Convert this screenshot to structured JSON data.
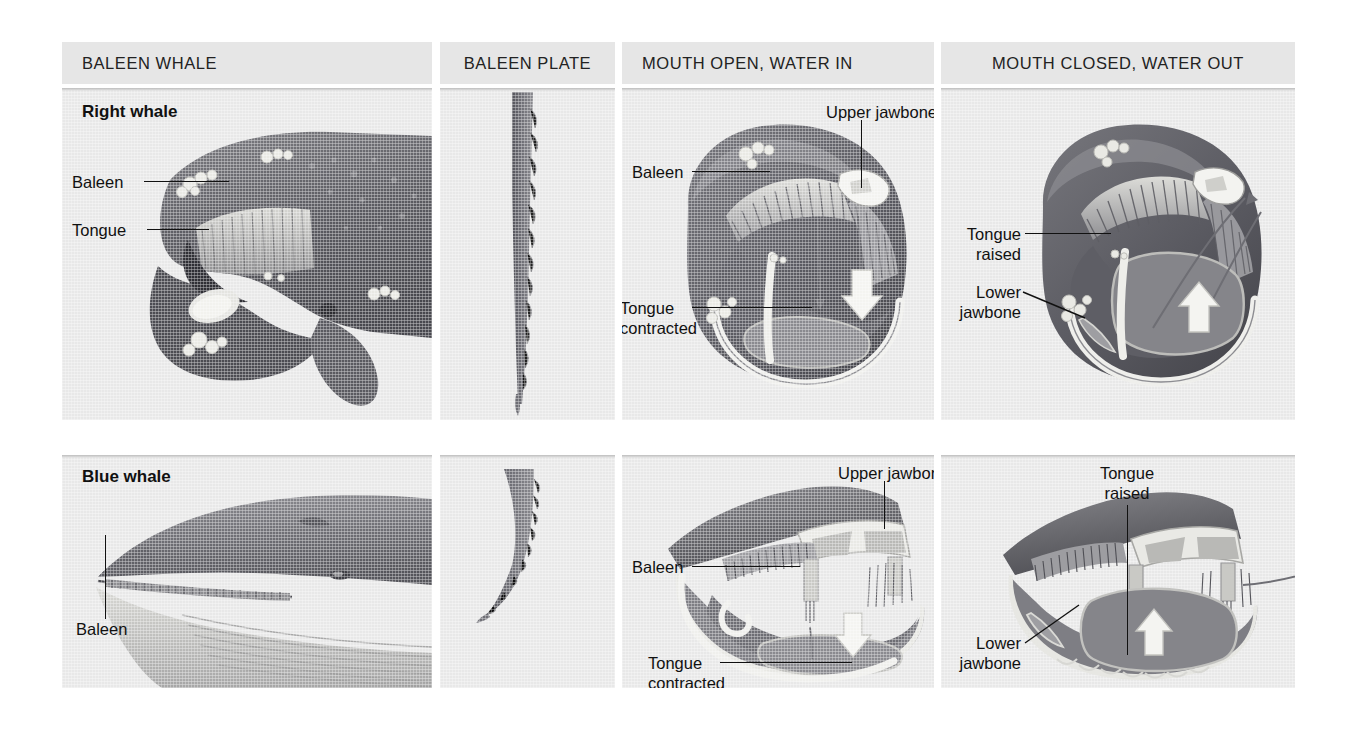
{
  "figure": {
    "background": "#ffffff",
    "panel_bg": "#e8e8e8",
    "header_bg": "#e6e6e6"
  },
  "columns": [
    {
      "key": "whale",
      "header": "BALEEN WHALE"
    },
    {
      "key": "plate",
      "header": "BALEEN PLATE"
    },
    {
      "key": "open",
      "header": "MOUTH OPEN, WATER IN"
    },
    {
      "key": "closed",
      "header": "MOUTH CLOSED, WATER OUT"
    }
  ],
  "rows": [
    {
      "key": "right",
      "title": "Right whale",
      "whale_labels": [
        "Baleen",
        "Tongue"
      ],
      "open_labels": {
        "baleen": "Baleen",
        "upper_jawbone": "Upper jawbone",
        "tongue": "Tongue\ncontracted"
      },
      "closed_labels": {
        "tongue": "Tongue\nraised",
        "lower_jawbone": "Lower\njawbone"
      }
    },
    {
      "key": "blue",
      "title": "Blue whale",
      "whale_labels": [
        "Baleen"
      ],
      "open_labels": {
        "baleen": "Baleen",
        "upper_jawbone": "Upper jawbone",
        "tongue": "Tongue\ncontracted"
      },
      "closed_labels": {
        "tongue": "Tongue\nraised",
        "lower_jawbone": "Lower\njawbone"
      }
    }
  ],
  "colors": {
    "body_dark": "#55555a",
    "body_mid": "#6f6f74",
    "body_light": "#9a9a9e",
    "baleen": "#8a8a8e",
    "bone": "#f2f2f0",
    "tongue": "#7d7d82",
    "arrow_white": "#f5f5f3",
    "ink": "#111111"
  }
}
